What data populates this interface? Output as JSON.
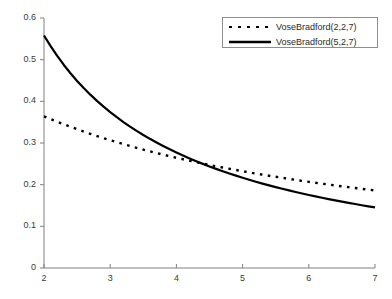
{
  "chart_data": {
    "type": "line",
    "title": "",
    "xlabel": "",
    "ylabel": "",
    "xlim": [
      2,
      7
    ],
    "ylim": [
      0,
      0.6
    ],
    "grid": false,
    "legend_position": "top-right",
    "xticks": [
      2,
      3,
      4,
      5,
      6,
      7
    ],
    "xtick_labels": [
      "2",
      "3",
      "4",
      "5",
      "6",
      "7"
    ],
    "yticks": [
      0,
      0.1,
      0.2,
      0.3,
      0.4,
      0.5,
      0.6
    ],
    "ytick_labels": [
      "0",
      "0.1",
      "0.2",
      "0.3",
      "0.4",
      "0.5",
      "0.6"
    ],
    "x": [
      2,
      2.1,
      2.2,
      2.3,
      2.4,
      2.5,
      2.6,
      2.7,
      2.8,
      2.9,
      3,
      3.1,
      3.2,
      3.3,
      3.4,
      3.5,
      3.6,
      3.7,
      3.8,
      3.9,
      4,
      4.1,
      4.2,
      4.3,
      4.4,
      4.5,
      4.6,
      4.7,
      4.8,
      4.9,
      5,
      5.1,
      5.2,
      5.3,
      5.4,
      5.5,
      5.6,
      5.7,
      5.8,
      5.9,
      6,
      6.1,
      6.2,
      6.3,
      6.4,
      6.5,
      6.6,
      6.7,
      6.8,
      6.9,
      7
    ],
    "series": [
      {
        "name": "VoseBradford(2,2,7)",
        "style": "dashed",
        "color": "#000000",
        "values": [
          0.3641,
          0.3575,
          0.3511,
          0.3449,
          0.3389,
          0.3331,
          0.3274,
          0.322,
          0.3167,
          0.3116,
          0.3067,
          0.3019,
          0.2972,
          0.2927,
          0.2883,
          0.2841,
          0.2799,
          0.2759,
          0.272,
          0.2682,
          0.2645,
          0.2609,
          0.2574,
          0.254,
          0.2506,
          0.2474,
          0.2442,
          0.2411,
          0.2381,
          0.2352,
          0.2323,
          0.2295,
          0.2267,
          0.2241,
          0.2214,
          0.2189,
          0.2164,
          0.2139,
          0.2115,
          0.2091,
          0.2068,
          0.2046,
          0.2024,
          0.2002,
          0.1981,
          0.196,
          0.194,
          0.192,
          0.19,
          0.1881,
          0.1862
        ]
      },
      {
        "name": "VoseBradford(5,2,7)",
        "style": "solid",
        "color": "#000000",
        "values": [
          0.5581,
          0.5324,
          0.5089,
          0.4873,
          0.4674,
          0.449,
          0.4319,
          0.416,
          0.4011,
          0.3872,
          0.3742,
          0.3619,
          0.3503,
          0.3394,
          0.3291,
          0.3193,
          0.31,
          0.3012,
          0.2928,
          0.2848,
          0.2772,
          0.2699,
          0.2629,
          0.2563,
          0.2499,
          0.2438,
          0.2379,
          0.2322,
          0.2268,
          0.2216,
          0.2166,
          0.2118,
          0.2071,
          0.2026,
          0.1983,
          0.1941,
          0.1901,
          0.1862,
          0.1824,
          0.1788,
          0.1753,
          0.1719,
          0.1686,
          0.1654,
          0.1623,
          0.1593,
          0.1563,
          0.1535,
          0.1507,
          0.1481,
          0.1455
        ]
      }
    ],
    "notes": {
      "curve_intersection_x": 3.3,
      "curve_intersection_y": 0.23
    }
  },
  "legend": {
    "entries": [
      {
        "label": "VoseBradford(2,2,7)",
        "style": "dashed"
      },
      {
        "label": "VoseBradford(5,2,7)",
        "style": "solid"
      }
    ]
  },
  "axes": {
    "line_color": "#808080",
    "tick_color": "#808080"
  }
}
